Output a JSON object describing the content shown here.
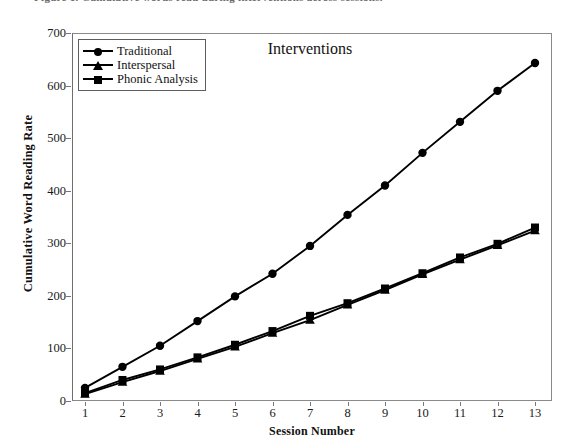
{
  "caption_fragment": "Figure 1. Cumulative words read during interventions across sessions.",
  "chart_title": "Interventions",
  "axes": {
    "x_title": "Session Number",
    "y_title": "Cumulative Word Reading Rate",
    "x_ticks": [
      "1",
      "2",
      "3",
      "4",
      "5",
      "6",
      "7",
      "8",
      "9",
      "10",
      "11",
      "12",
      "13"
    ],
    "y_ticks": [
      "0",
      "100",
      "200",
      "300",
      "400",
      "500",
      "600",
      "700"
    ]
  },
  "legend": {
    "position": "top-left inside plot",
    "items": [
      {
        "label": "Traditional",
        "marker": "circle",
        "color": "#000000"
      },
      {
        "label": "Interspersal",
        "marker": "triangle",
        "color": "#000000"
      },
      {
        "label": "Phonic Analysis",
        "marker": "square",
        "color": "#000000"
      }
    ]
  },
  "chart_data": {
    "type": "line",
    "title": "Interventions",
    "xlabel": "Session Number",
    "ylabel": "Cumulative Word Reading Rate",
    "xlim": [
      1,
      13
    ],
    "ylim": [
      0,
      700
    ],
    "ytick_step": 100,
    "grid": false,
    "legend_position": "upper left",
    "x": [
      1,
      2,
      3,
      4,
      5,
      6,
      7,
      8,
      9,
      10,
      11,
      12,
      13
    ],
    "categories": [
      "1",
      "2",
      "3",
      "4",
      "5",
      "6",
      "7",
      "8",
      "9",
      "10",
      "11",
      "12",
      "13"
    ],
    "series": [
      {
        "name": "Traditional",
        "marker": "circle",
        "color": "#000000",
        "values": [
          25,
          65,
          105,
          152,
          199,
          242,
          295,
          354,
          410,
          472,
          531,
          590,
          643
        ]
      },
      {
        "name": "Interspersal",
        "marker": "triangle",
        "color": "#000000",
        "values": [
          13,
          36,
          57,
          80,
          103,
          129,
          154,
          183,
          211,
          241,
          269,
          296,
          324
        ]
      },
      {
        "name": "Phonic Analysis",
        "marker": "square",
        "color": "#000000",
        "values": [
          15,
          40,
          60,
          83,
          107,
          133,
          162,
          186,
          214,
          243,
          273,
          299,
          330
        ]
      }
    ]
  }
}
